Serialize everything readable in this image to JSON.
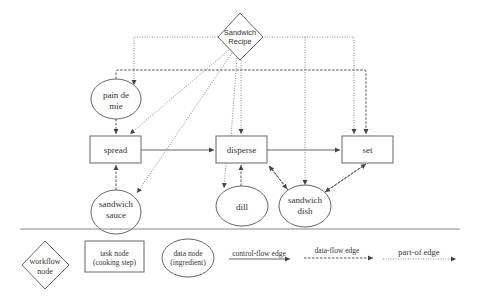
{
  "diagram": {
    "workflow": {
      "line1": "Sandwich",
      "line2": "Recipe"
    },
    "data_nodes": {
      "pain_de_mie": {
        "line1": "pain de",
        "line2": "mie"
      },
      "sandwich_sauce": {
        "line1": "sandwich",
        "line2": "sauce"
      },
      "dill": {
        "line1": "dill"
      },
      "sandwich_dish": {
        "line1": "sandwich",
        "line2": "dish"
      }
    },
    "task_nodes": {
      "spread": "spread",
      "disperse": "disperse",
      "set": "set"
    },
    "edges": {
      "control_flow": [
        [
          "spread",
          "disperse"
        ],
        [
          "disperse",
          "set"
        ]
      ],
      "data_flow": [
        [
          "pain de mie",
          "spread"
        ],
        [
          "sandwich sauce",
          "spread"
        ],
        [
          "dill",
          "disperse"
        ],
        [
          "disperse",
          "sandwich dish"
        ],
        [
          "sandwich dish",
          "set"
        ]
      ],
      "part_of": [
        [
          "Sandwich Recipe",
          "pain de mie"
        ],
        [
          "Sandwich Recipe",
          "spread"
        ],
        [
          "Sandwich Recipe",
          "sandwich sauce"
        ],
        [
          "Sandwich Recipe",
          "disperse"
        ],
        [
          "Sandwich Recipe",
          "dill"
        ],
        [
          "Sandwich Recipe",
          "sandwich dish"
        ],
        [
          "Sandwich Recipe",
          "set"
        ]
      ]
    }
  },
  "legend": {
    "workflow_node": {
      "line1": "workflow",
      "line2": "node"
    },
    "task_node": {
      "line1": "task node",
      "line2": "(cooking step)"
    },
    "data_node": {
      "line1": "data node",
      "line2": "(ingredient)"
    },
    "control_flow_edge": "control-flow edge",
    "data_flow_edge": "data-flow edge",
    "part_of_edge": "part-of edge"
  },
  "colors": {
    "stroke": "#666666",
    "text": "#333333",
    "background": "#ffffff"
  }
}
